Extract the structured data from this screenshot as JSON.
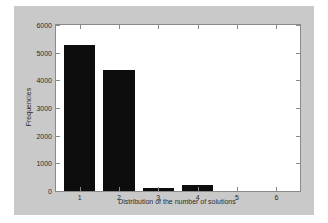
{
  "chart_data": {
    "type": "bar",
    "title": "",
    "xlabel": "Distribution of the number of solutions",
    "ylabel": "Frequencies",
    "categories": [
      "1",
      "2",
      "3",
      "4",
      "5",
      "6"
    ],
    "values": [
      5270,
      4370,
      110,
      220,
      0,
      0
    ],
    "xlim": [
      0.4,
      6.6
    ],
    "ylim": [
      0,
      6000
    ],
    "ytick_labels": [
      "0",
      "1000",
      "2000",
      "3000",
      "4000",
      "5000",
      "6000"
    ],
    "ytick_values": [
      0,
      1000,
      2000,
      3000,
      4000,
      5000,
      6000
    ],
    "xtick_labels": [
      "1",
      "2",
      "3",
      "4",
      "5",
      "6"
    ],
    "grid": false,
    "legend": null,
    "bar_color": "#0d0d0d",
    "figure_background": "#c9c9c9",
    "axes_background": "#ffffff",
    "axis_color": "#8a8a8a"
  }
}
